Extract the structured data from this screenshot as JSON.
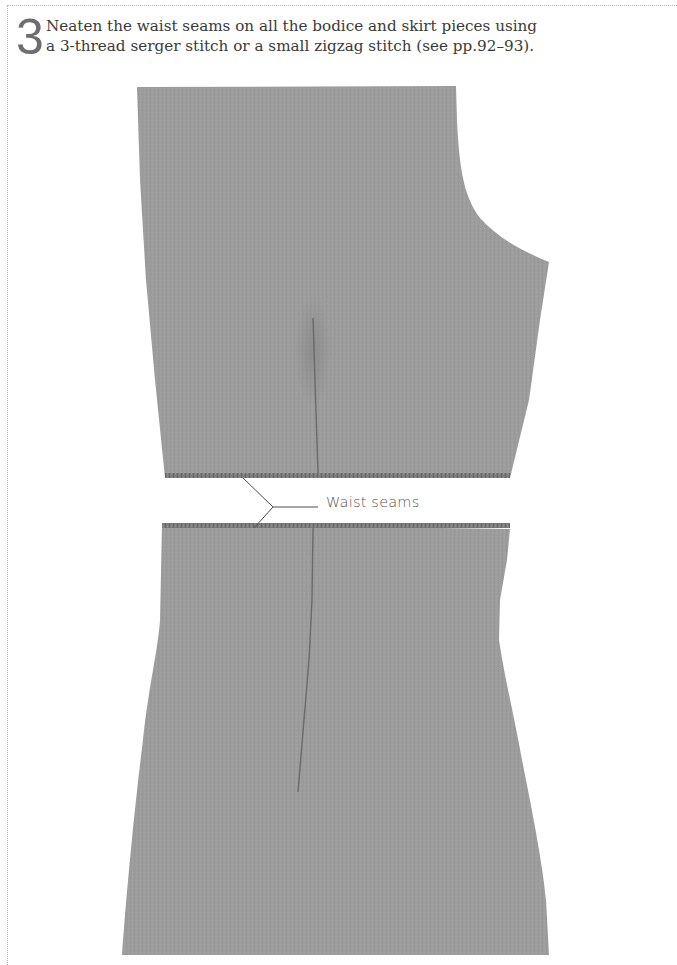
{
  "instruction": {
    "step_number": "3",
    "text_line_1": "Neaten the waist seams on all the bodice and skirt pieces using",
    "text_line_2": "a 3-thread serger stitch or a small zigzag stitch (see pp.92–93)."
  },
  "illustration": {
    "pieces": [
      "bodice-front",
      "skirt-front"
    ],
    "callout": {
      "label": "Waist seams"
    },
    "colors": {
      "fabric": "#9c9c9c",
      "fabric_edge": "#7a7a7a",
      "dart": "#6a6a6a",
      "leader_line": "#555555",
      "step_number": "#6e6e6e",
      "body_text": "#3a3a3a"
    }
  }
}
